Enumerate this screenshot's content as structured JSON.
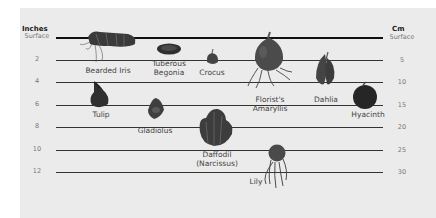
{
  "diagram": {
    "left_axis": {
      "title": "Inches",
      "ticks": [
        {
          "label": "Surface",
          "y": 37
        },
        {
          "label": "2",
          "y": 60
        },
        {
          "label": "4",
          "y": 82
        },
        {
          "label": "6",
          "y": 105
        },
        {
          "label": "8",
          "y": 127
        },
        {
          "label": "10",
          "y": 150
        },
        {
          "label": "12",
          "y": 172
        }
      ]
    },
    "right_axis": {
      "title": "Cm",
      "ticks": [
        {
          "label": "Surface",
          "y": 37
        },
        {
          "label": "5",
          "y": 60
        },
        {
          "label": "10",
          "y": 82
        },
        {
          "label": "15",
          "y": 105
        },
        {
          "label": "20",
          "y": 127
        },
        {
          "label": "25",
          "y": 150
        },
        {
          "label": "30",
          "y": 172
        }
      ]
    },
    "bulbs": [
      {
        "name": "Bearded Iris",
        "label_lines": [
          "Bearded Iris"
        ],
        "x": 108,
        "label_y": 66
      },
      {
        "name": "Tuberous Begonia",
        "label_lines": [
          "Tuberous",
          "Begonia"
        ],
        "x": 169,
        "label_y": 59
      },
      {
        "name": "Crocus",
        "label_lines": [
          "Crocus"
        ],
        "x": 212,
        "label_y": 68
      },
      {
        "name": "Florist's Amaryllis",
        "label_lines": [
          "Florist's",
          "Amaryllis"
        ],
        "x": 270,
        "label_y": 95
      },
      {
        "name": "Dahlia",
        "label_lines": [
          "Dahlia"
        ],
        "x": 326,
        "label_y": 95
      },
      {
        "name": "Hyacinth",
        "label_lines": [
          "Hyacinth"
        ],
        "x": 368,
        "label_y": 110
      },
      {
        "name": "Tulip",
        "label_lines": [
          "Tulip"
        ],
        "x": 101,
        "label_y": 110
      },
      {
        "name": "Gladiolus",
        "label_lines": [
          "Gladiolus"
        ],
        "x": 155,
        "label_y": 126
      },
      {
        "name": "Daffodil (Narcissus)",
        "label_lines": [
          "Daffodil",
          "(Narcissus)"
        ],
        "x": 217,
        "label_y": 150
      },
      {
        "name": "Lily",
        "label_lines": [
          "Lily"
        ],
        "x": 256,
        "label_y": 177
      }
    ]
  }
}
